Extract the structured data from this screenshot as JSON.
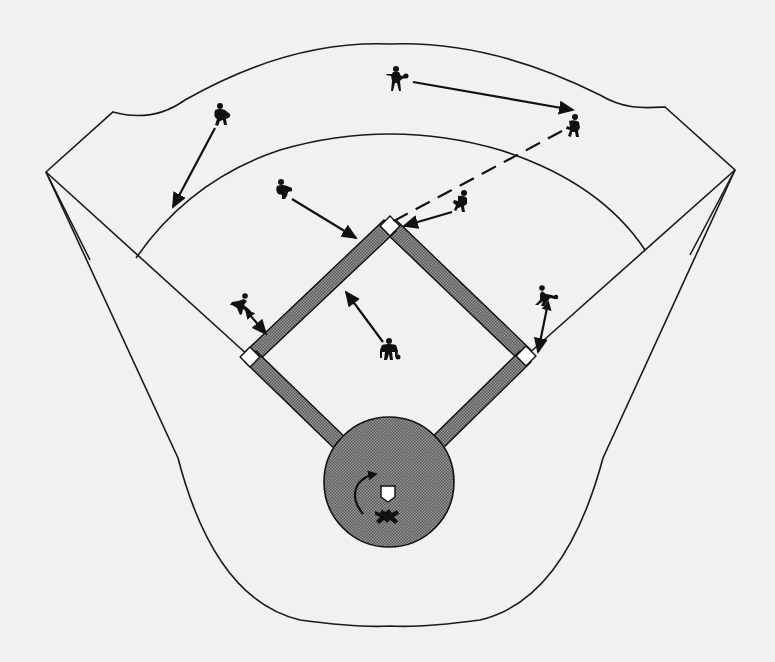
{
  "diagram": {
    "colors": {
      "background": "#f1f1ef",
      "field_fill": "#f8f8f6",
      "line": "#1a1a1a",
      "basepath_fill": "#7a7a7a",
      "home_circle_fill": "#7d7d7d",
      "base_fill": "#ffffff",
      "player": "#111111"
    },
    "players": [
      {
        "id": "left-fielder",
        "x": 222,
        "y": 117,
        "icon": "crouching-fielder"
      },
      {
        "id": "center-fielder",
        "x": 396,
        "y": 80,
        "icon": "standing-fielder-with-glove"
      },
      {
        "id": "right-fielder",
        "x": 573,
        "y": 128,
        "icon": "crouching-fielder"
      },
      {
        "id": "shortstop",
        "x": 284,
        "y": 192,
        "icon": "crouching-fielder"
      },
      {
        "id": "second-baseman",
        "x": 461,
        "y": 203,
        "icon": "crouching-fielder"
      },
      {
        "id": "third-baseman",
        "x": 240,
        "y": 310,
        "icon": "running-fielder"
      },
      {
        "id": "first-baseman",
        "x": 548,
        "y": 300,
        "icon": "running-fielder"
      },
      {
        "id": "pitcher",
        "x": 389,
        "y": 352,
        "icon": "pitcher-crouch"
      },
      {
        "id": "catcher",
        "x": 387,
        "y": 517,
        "icon": "catcher"
      }
    ],
    "arrows": [
      {
        "id": "left-fielder-arrow",
        "from": [
          215,
          128
        ],
        "to": [
          173,
          207
        ],
        "style": "solid"
      },
      {
        "id": "center-fielder-arrow",
        "from": [
          413,
          82
        ],
        "to": [
          573,
          110
        ],
        "style": "solid"
      },
      {
        "id": "shortstop-arrow",
        "from": [
          290,
          198
        ],
        "to": [
          356,
          238
        ],
        "style": "solid",
        "double": true
      },
      {
        "id": "second-baseman-arrow",
        "from": [
          452,
          212
        ],
        "to": [
          404,
          226
        ],
        "style": "solid"
      },
      {
        "id": "relay-dashed-line",
        "from": [
          562,
          131
        ],
        "to": [
          390,
          224
        ],
        "style": "dashed"
      },
      {
        "id": "third-baseman-arrow",
        "from": [
          248,
          313
        ],
        "to": [
          265,
          333
        ],
        "style": "solid",
        "double": true
      },
      {
        "id": "first-baseman-arrow",
        "from": [
          547,
          307
        ],
        "to": [
          538,
          350
        ],
        "style": "solid",
        "double": true
      },
      {
        "id": "pitcher-arrow",
        "from": [
          383,
          342
        ],
        "to": [
          346,
          292
        ],
        "style": "solid"
      },
      {
        "id": "catcher-rotation-arrow",
        "type": "curved",
        "center": [
          366,
          487
        ],
        "style": "solid"
      }
    ],
    "bases": {
      "second": [
        390,
        226
      ],
      "first": [
        526,
        356
      ],
      "third": [
        250,
        357
      ],
      "home_plate": [
        388,
        492
      ]
    },
    "home_circle": {
      "cx": 389,
      "cy": 482,
      "r": 65
    }
  }
}
